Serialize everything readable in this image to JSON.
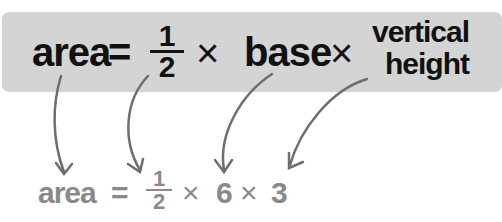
{
  "formula": {
    "area": "area",
    "equals": "=",
    "half_num": "1",
    "half_den": "2",
    "times": "×",
    "base": "base",
    "vh_line1": "vertical",
    "vh_line2": "height"
  },
  "example": {
    "area": "area",
    "equals": "=",
    "half_num": "1",
    "half_den": "2",
    "times1": "×",
    "base_value": "6",
    "times2": "×",
    "height_value": "3"
  },
  "colors": {
    "box_bg": "#d4d4d4",
    "formula_text": "#111111",
    "example_text": "#8a8a8a",
    "arrow": "#6e6e6e"
  }
}
